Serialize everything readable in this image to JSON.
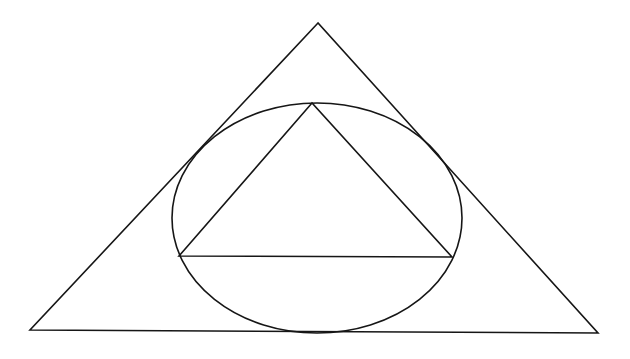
{
  "diagram": {
    "title": "",
    "stroke_color": "#161616",
    "background_color": "#ffffff",
    "shapes": {
      "outer_triangle": {
        "points": [
          [
            318,
            23
          ],
          [
            30,
            330
          ],
          [
            598,
            333
          ]
        ]
      },
      "ellipse": {
        "cx": 317,
        "cy": 218,
        "rx": 145,
        "ry": 115
      },
      "inner_triangle": {
        "points": [
          [
            312,
            103
          ],
          [
            179,
            256
          ],
          [
            452,
            257
          ]
        ]
      }
    }
  }
}
